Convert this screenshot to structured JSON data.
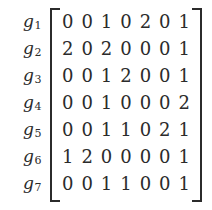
{
  "figure": {
    "type": "matrix",
    "row_labels": [
      {
        "symbol": "g",
        "subscript": "1"
      },
      {
        "symbol": "g",
        "subscript": "2"
      },
      {
        "symbol": "g",
        "subscript": "3"
      },
      {
        "symbol": "g",
        "subscript": "4"
      },
      {
        "symbol": "g",
        "subscript": "5"
      },
      {
        "symbol": "g",
        "subscript": "6"
      },
      {
        "symbol": "g",
        "subscript": "7"
      }
    ],
    "rows": [
      [
        "0",
        "0",
        "1",
        "0",
        "2",
        "0",
        "1"
      ],
      [
        "2",
        "0",
        "2",
        "0",
        "0",
        "0",
        "1"
      ],
      [
        "0",
        "0",
        "1",
        "2",
        "0",
        "0",
        "1"
      ],
      [
        "0",
        "0",
        "1",
        "0",
        "0",
        "0",
        "2"
      ],
      [
        "0",
        "0",
        "1",
        "1",
        "0",
        "2",
        "1"
      ],
      [
        "1",
        "2",
        "0",
        "0",
        "0",
        "0",
        "1"
      ],
      [
        "0",
        "0",
        "1",
        "1",
        "0",
        "0",
        "1"
      ]
    ],
    "n_rows": 7,
    "n_cols": 7,
    "text_color": "#2b2b2b",
    "background_color": "#ffffff"
  }
}
